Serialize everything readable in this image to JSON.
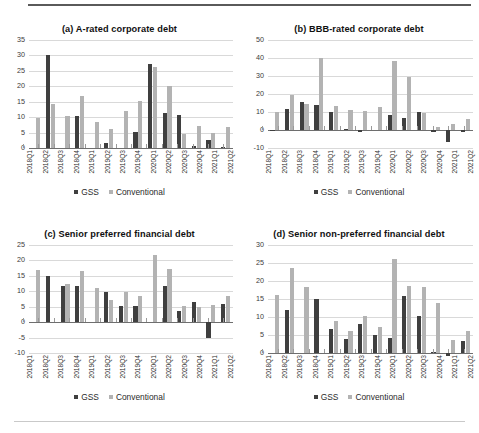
{
  "figure": {
    "legend": {
      "gss_label": "GSS",
      "conventional_label": "Conventional"
    },
    "colors": {
      "gss": "#3f3f3f",
      "conventional": "#b3b3b3",
      "gridline": "#d9d9d9",
      "axis": "#6e6e6e"
    }
  },
  "chart_data": [
    {
      "type": "bar",
      "panel": "a",
      "title": "(a)  A-rated corporate debt",
      "xlabel": "",
      "ylabel": "",
      "ylim": [
        0,
        35
      ],
      "yticks": [
        0,
        5,
        10,
        15,
        20,
        25,
        30,
        35
      ],
      "grid": true,
      "legend_position": "bottom",
      "categories": [
        "2018Q1",
        "2018Q2",
        "2018Q3",
        "2018Q4",
        "2019Q1",
        "2019Q2",
        "2019Q3",
        "2019Q4",
        "2020Q1",
        "2020Q2",
        "2020Q3",
        "2020Q4",
        "2021Q1",
        "2021Q2"
      ],
      "series": [
        {
          "name": "GSS",
          "values": [
            0,
            30.2,
            0,
            10.3,
            0,
            1.7,
            0,
            5.1,
            27.3,
            11.3,
            10.6,
            0.7,
            2.5,
            0.3
          ]
        },
        {
          "name": "Conventional",
          "values": [
            9.8,
            14.2,
            10.5,
            16.9,
            8.3,
            6.3,
            11.9,
            15.1,
            26.3,
            20.2,
            4.5,
            7.0,
            4.9,
            6.8
          ]
        }
      ]
    },
    {
      "type": "bar",
      "panel": "b",
      "title": "(b)  BBB-rated corporate debt",
      "xlabel": "",
      "ylabel": "",
      "ylim": [
        -10,
        50
      ],
      "yticks": [
        -10,
        0,
        10,
        20,
        30,
        40,
        50
      ],
      "grid": true,
      "legend_position": "bottom",
      "categories": [
        "2018Q1",
        "2018Q2",
        "2018Q3",
        "2018Q4",
        "2019Q1",
        "2019Q2",
        "2019Q3",
        "2019Q4",
        "2020Q1",
        "2020Q2",
        "2020Q3",
        "2020Q4",
        "2021Q1",
        "2021Q2"
      ],
      "series": [
        {
          "name": "GSS",
          "values": [
            -0.5,
            11.9,
            15.7,
            13.9,
            10.1,
            0.6,
            -1.1,
            0,
            8.3,
            6.7,
            9.8,
            -1.2,
            -6.5,
            -1.0
          ]
        },
        {
          "name": "Conventional",
          "values": [
            10.0,
            19.3,
            14.2,
            39.8,
            13.6,
            11.3,
            10.7,
            12.8,
            38.1,
            29.4,
            9.5,
            1.8,
            3.6,
            6.0
          ]
        }
      ]
    },
    {
      "type": "bar",
      "panel": "c",
      "title": "(c)  Senior preferred financial debt",
      "xlabel": "",
      "ylabel": "",
      "ylim": [
        -10,
        25
      ],
      "yticks": [
        -10,
        -5,
        0,
        5,
        10,
        15,
        20,
        25
      ],
      "grid": true,
      "legend_position": "bottom",
      "categories": [
        "2018Q1",
        "2018Q2",
        "2018Q3",
        "2018Q4",
        "2019Q1",
        "2019Q2",
        "2019Q3",
        "2019Q4",
        "2020Q1",
        "2020Q2",
        "2020Q3",
        "2020Q4",
        "2021Q1",
        "2021Q2"
      ],
      "series": [
        {
          "name": "GSS",
          "values": [
            0,
            14.9,
            11.8,
            11.7,
            0,
            9.9,
            5.2,
            5.2,
            0,
            11.8,
            3.7,
            6.4,
            -5.0,
            5.9
          ]
        },
        {
          "name": "Conventional",
          "values": [
            16.9,
            0,
            12.3,
            16.6,
            11.2,
            7.2,
            9.7,
            8.5,
            21.9,
            17.3,
            5.3,
            5.0,
            5.7,
            8.4
          ]
        }
      ]
    },
    {
      "type": "bar",
      "panel": "d",
      "title": "(d)  Senior non-preferred financial debt",
      "xlabel": "",
      "ylabel": "",
      "ylim": [
        0,
        30
      ],
      "yticks": [
        0,
        5,
        10,
        15,
        20,
        25,
        30
      ],
      "grid": true,
      "legend_position": "bottom",
      "categories": [
        "2018Q1",
        "2018Q2",
        "2018Q3",
        "2018Q4",
        "2019Q1",
        "2019Q2",
        "2019Q3",
        "2019Q4",
        "2020Q1",
        "2020Q2",
        "2020Q3",
        "2020Q4",
        "2021Q1",
        "2021Q2"
      ],
      "series": [
        {
          "name": "GSS",
          "values": [
            0,
            11.9,
            0,
            14.9,
            6.8,
            3.8,
            8.1,
            5.1,
            4.2,
            15.8,
            10.4,
            0.2,
            -0.8,
            3.4
          ]
        },
        {
          "name": "Conventional",
          "values": [
            16.2,
            23.6,
            18.4,
            0,
            8.9,
            6.2,
            10.2,
            7.3,
            26.0,
            18.5,
            18.2,
            14.0,
            3.7,
            6.1
          ]
        }
      ]
    }
  ]
}
